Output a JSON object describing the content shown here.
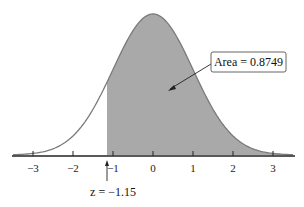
{
  "chart_data": {
    "type": "area",
    "title": "",
    "xlabel": "",
    "ylabel": "",
    "distribution": "standard normal",
    "xlim": [
      -3.5,
      3.5
    ],
    "x_ticks": [
      -3,
      -2,
      -1,
      0,
      1,
      2,
      3
    ],
    "x_tick_labels": [
      "−3",
      "−2",
      "−1",
      "0",
      "1",
      "2",
      "3"
    ],
    "shaded_region": {
      "from": -1.15,
      "to": "infinity"
    },
    "annotations": [
      {
        "text": "Area = 0.8749",
        "type": "callout-box",
        "points_to": "shaded-region"
      },
      {
        "text": "z = −1.15",
        "type": "arrow-label",
        "x": -1.15
      }
    ],
    "grid": false,
    "legend": null
  },
  "labels": {
    "area": "Area = 0.8749",
    "z": "z = −1.15",
    "ticks": [
      "−3",
      "−2",
      "−1",
      "0",
      "1",
      "2",
      "3"
    ]
  },
  "colors": {
    "shade": "#a9a9a9",
    "curve": "#7a7a7a",
    "axis": "#222222"
  }
}
